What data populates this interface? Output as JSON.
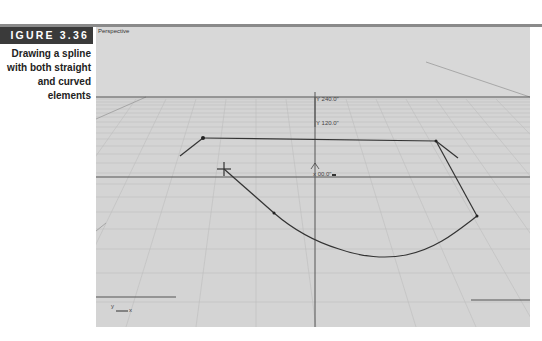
{
  "figure": {
    "tag": "IGURE 3.36",
    "caption": "Drawing a spline with both straight and curved elements"
  },
  "viewport": {
    "label": "Perspective",
    "background": "#d4d4d4",
    "coordinates": {
      "y240": "Y 240.0\"",
      "y120": "Y 120.0\"",
      "x0": "x 00.0\""
    },
    "axis_icon": {
      "y": "y",
      "x": "x"
    }
  }
}
